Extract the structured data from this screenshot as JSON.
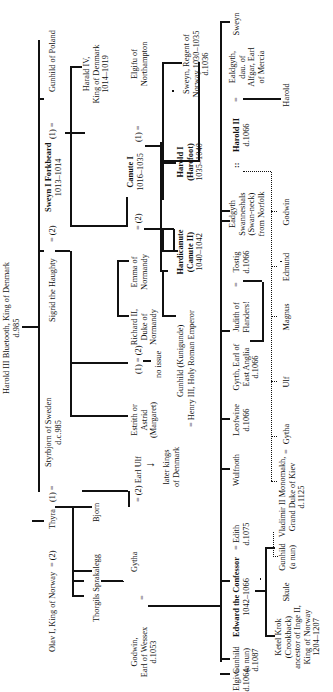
{
  "diagram": {
    "type": "family-tree",
    "orientation": "rotated-90-ccw",
    "root": {
      "name": "Harold III Bluetooth, King of Denmark",
      "death": "d.985"
    },
    "generation1": {
      "gunhild_poland": "Gunhild of Poland",
      "m1": "(1) =",
      "sweyn": "Sweyn I Forkbeard",
      "sweyn_reign": "1013–1014",
      "m2": "= (2)",
      "sigrid": "Sigrid the Haughty",
      "styrbjorn": "Styrbjorn of Sweden",
      "styrbjorn_death": "d.c.985",
      "m3": "(1) =",
      "thyra": "Thyra",
      "m4": "= (2)",
      "olav": "Olav I, King of Norway"
    },
    "generation2": {
      "harald4": [
        "Harald IV,",
        "King of Denmark",
        "1014–1019"
      ],
      "elgifu": [
        "Elgifu of",
        "Northampton"
      ],
      "m_elgifu": "(1) =",
      "canute": "Canute I",
      "canute_reign": "1016–1035",
      "m_emma": "= (2)",
      "emma": [
        "Emma of",
        "Normandy"
      ],
      "richard": [
        "Richard II,",
        "Duke of",
        "Normandy"
      ],
      "m_estrith": "(1) = (2)",
      "no_issue": "no issue",
      "estrith": [
        "Estrith or",
        "Astrid",
        "(Margaret)"
      ],
      "m_ulf": "= (2) Earl Ulf",
      "later_kings": [
        "later kings",
        "of Denmark"
      ],
      "arrow": "down-arrow",
      "bjorn": "Bjorn",
      "thorgils": "Thorgils Sprakalegg",
      "gytha": "Gytha",
      "m_godwin": "=",
      "godwin": [
        "Godwin,",
        "Earl of Wessex",
        "d.1053"
      ]
    },
    "generation3": {
      "sweyn_regent": [
        "Sweyn, Regent of",
        "Norway 1030–1035",
        "d.1036"
      ],
      "harold1": [
        "Harold I",
        "(Harefoot)"
      ],
      "harold1_reign": "1035–1040",
      "hardicanute": [
        "Hardicanute",
        "(Canute II)"
      ],
      "hardicanute_reign": "1040–1042",
      "gunhild_kunigunde": "Gunhild (Kunigunde)",
      "henry3": "= Henry III, Holy Roman Emperor"
    },
    "godwin_children": {
      "sweyn": "Sweyn",
      "ealdgyth": [
        "Ealdgyth,",
        "dau. of",
        "Alfgar, Earl",
        "of Mercia"
      ],
      "m_ealdgyth": "=",
      "harold2": "Harold II",
      "harold2_death": "d.1066",
      "m_edgyth": "::",
      "eadgyth": [
        "Eadgyth",
        "Swanneshals",
        "(Swan-neck)",
        "from Norfolk"
      ],
      "tostig": [
        "Tostig",
        "d.1066"
      ],
      "m_judith": "=",
      "judith": [
        "Judith of",
        "Flanders!"
      ],
      "gyrth": [
        "Gyrth, Earl of",
        "East Anglia",
        "d.1066"
      ],
      "leofwine": [
        "Leofwine",
        "d.1066"
      ],
      "wulfnoth": "Wulfnoth",
      "edith": [
        "Edith",
        "d.1075"
      ],
      "m_edward": "=",
      "edward": "Edward the Confessor",
      "edward_reign": "1042–1066",
      "gunhild_nun": [
        "Gunhild",
        "(a nun)",
        "d.1087"
      ],
      "elgiva": [
        "Elgiva",
        "d.1064"
      ]
    },
    "grandchildren": {
      "harold": "Harold",
      "godwin": "Godwin",
      "edmund": "Edmund",
      "magnus": "Magnus",
      "ulf": "Ulf",
      "gytha": "Gytha",
      "m_vladimir": "=",
      "vladimir": [
        "Vladimir II Monomakh,",
        "Grand Duke of Kiev",
        "d.1125"
      ],
      "gunhild": [
        "Gunhild",
        "(a nun)"
      ],
      "skule": "Skule",
      "ketel": [
        "Ketel Krok",
        "(Crookback)",
        "ancestor of Inge II,",
        "King of Norway",
        "1204–1207"
      ]
    },
    "line_color": "#111111",
    "background": "#ffffff"
  }
}
